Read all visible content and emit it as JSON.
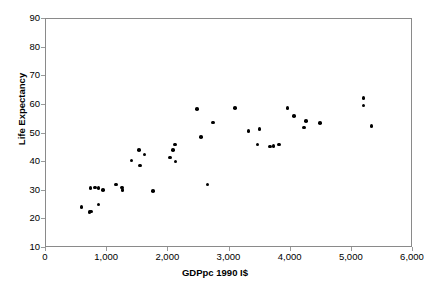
{
  "chart_data": {
    "type": "scatter",
    "title": "",
    "xlabel": "GDPpc 1990 I$",
    "ylabel": "Life Expectancy",
    "xlim": [
      0,
      6000
    ],
    "ylim": [
      10,
      90
    ],
    "xticks": [
      0,
      1000,
      2000,
      3000,
      4000,
      5000,
      6000
    ],
    "xtick_labels": [
      "0",
      "1,000",
      "2,000",
      "3,000",
      "4,000",
      "5,000",
      "6,000"
    ],
    "yticks": [
      10,
      20,
      30,
      40,
      50,
      60,
      70,
      80,
      90
    ],
    "ytick_labels": [
      "10",
      "20",
      "30",
      "40",
      "50",
      "60",
      "70",
      "80",
      "90"
    ],
    "grid": false,
    "legend": null,
    "marker": {
      "shape": "circle",
      "color": "#000000",
      "size_px": 3.6
    },
    "series": [
      {
        "name": "Countries",
        "points": [
          {
            "x": 580,
            "y": 24.3
          },
          {
            "x": 710,
            "y": 22.5
          },
          {
            "x": 735,
            "y": 22.8
          },
          {
            "x": 725,
            "y": 31.0
          },
          {
            "x": 800,
            "y": 31.1
          },
          {
            "x": 855,
            "y": 25.2
          },
          {
            "x": 860,
            "y": 30.9
          },
          {
            "x": 930,
            "y": 30.2
          },
          {
            "x": 1140,
            "y": 32.2
          },
          {
            "x": 1245,
            "y": 31.1
          },
          {
            "x": 1250,
            "y": 30.3
          },
          {
            "x": 1400,
            "y": 40.5
          },
          {
            "x": 1520,
            "y": 44.3
          },
          {
            "x": 1540,
            "y": 38.8
          },
          {
            "x": 1610,
            "y": 42.7
          },
          {
            "x": 1745,
            "y": 29.9
          },
          {
            "x": 2030,
            "y": 41.6
          },
          {
            "x": 2080,
            "y": 44.3
          },
          {
            "x": 2110,
            "y": 46.1
          },
          {
            "x": 2115,
            "y": 40.2
          },
          {
            "x": 2470,
            "y": 58.6
          },
          {
            "x": 2530,
            "y": 48.8
          },
          {
            "x": 2640,
            "y": 32.2
          },
          {
            "x": 2730,
            "y": 53.9
          },
          {
            "x": 3090,
            "y": 58.9
          },
          {
            "x": 3310,
            "y": 50.8
          },
          {
            "x": 3460,
            "y": 46.1
          },
          {
            "x": 3490,
            "y": 51.6
          },
          {
            "x": 3660,
            "y": 45.4
          },
          {
            "x": 3720,
            "y": 45.6
          },
          {
            "x": 3810,
            "y": 46.2
          },
          {
            "x": 3950,
            "y": 58.9
          },
          {
            "x": 4050,
            "y": 56.2
          },
          {
            "x": 4220,
            "y": 52.1
          },
          {
            "x": 4250,
            "y": 54.3
          },
          {
            "x": 4480,
            "y": 53.6
          },
          {
            "x": 5190,
            "y": 62.3
          },
          {
            "x": 5190,
            "y": 59.8
          },
          {
            "x": 5320,
            "y": 52.6
          }
        ]
      }
    ]
  }
}
